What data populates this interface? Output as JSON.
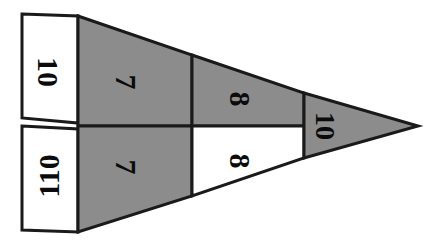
{
  "figure": {
    "title": "",
    "type": "partitioned-triangle-diagram",
    "canvas": {
      "width": 441,
      "height": 246
    },
    "colors": {
      "gray_fill": "#8c8c8c",
      "white_fill": "#ffffff",
      "outline": "#1a1a1a",
      "label_color": "#0b0b0b",
      "background": "#ffffff"
    },
    "segments": [
      {
        "id": "upper-left-flap",
        "label": "10",
        "fill": "white",
        "rotation_deg": 90,
        "position": "upper-left-outer",
        "label_x": 48,
        "label_y": 72
      },
      {
        "id": "lower-left-flap",
        "label": "110",
        "fill": "white",
        "rotation_deg": -90,
        "position": "lower-left-outer",
        "label_x": 48,
        "label_y": 176
      },
      {
        "id": "upper-inner",
        "label": "7",
        "fill": "gray",
        "rotation_deg": 90,
        "position": "upper-left-inner",
        "label_x": 126,
        "label_y": 82
      },
      {
        "id": "lower-inner",
        "label": "7",
        "fill": "gray",
        "rotation_deg": 90,
        "position": "lower-left-inner",
        "label_x": 126,
        "label_y": 167
      },
      {
        "id": "upper-middle",
        "label": "8",
        "fill": "gray",
        "rotation_deg": 90,
        "position": "upper-middle",
        "label_x": 240,
        "label_y": 99
      },
      {
        "id": "lower-middle",
        "label": "8",
        "fill": "white",
        "rotation_deg": 90,
        "position": "lower-middle",
        "label_x": 240,
        "label_y": 161
      },
      {
        "id": "right-tip",
        "label": "10",
        "fill": "gray",
        "rotation_deg": 90,
        "position": "right-tip",
        "label_x": 325,
        "label_y": 126
      }
    ],
    "geometry": {
      "apex": {
        "x": 418,
        "y": 126
      },
      "top_left": {
        "x": 78,
        "y": 16
      },
      "bottom_left": {
        "x": 78,
        "y": 232
      },
      "midline_y": 126,
      "divider_x_inner": 192,
      "divider_x_tip": 304,
      "flap_outer_x": 22,
      "flap_top_y": 14,
      "flap_bottom_y": 230
    }
  }
}
